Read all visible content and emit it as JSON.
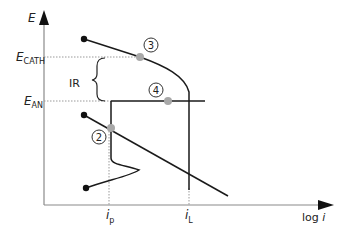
{
  "axes": {
    "y_label": "E",
    "x_label_prefix": "log ",
    "x_label_var": "i"
  },
  "potentials": {
    "cath_main": "E",
    "cath_sub": "CATH",
    "an_main": "E",
    "an_sub": "AN"
  },
  "ir_label": "IR",
  "currents": {
    "p_main": "i",
    "p_sub": "p",
    "l_main": "i",
    "l_sub": "L"
  },
  "markers": {
    "m2": "2",
    "m3": "3",
    "m4": "4"
  },
  "colors": {
    "line": "#1a1a1a",
    "dot_gray": "#a8a8a8",
    "dotted": "#999999"
  }
}
